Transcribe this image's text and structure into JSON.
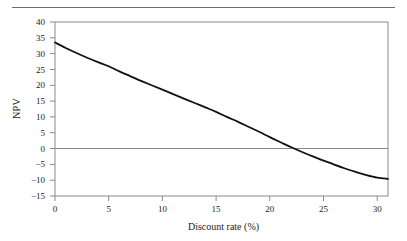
{
  "figure": {
    "top_rule": true,
    "background": "#ffffff",
    "frame_color": "#8a8a8a",
    "curve_color": "#111111",
    "text_color": "#1c1c1c"
  },
  "chart_data": {
    "type": "line",
    "title": "",
    "xlabel": "Discount rate (%)",
    "ylabel": "NPV",
    "xlim": [
      0,
      31
    ],
    "ylim": [
      -15,
      40
    ],
    "xticks": [
      0,
      5,
      10,
      15,
      20,
      25,
      30
    ],
    "xtick_labels": [
      "0",
      "5",
      "10",
      "15",
      "20",
      "25",
      "30"
    ],
    "yticks": [
      -15,
      -10,
      -5,
      0,
      5,
      10,
      15,
      20,
      25,
      30,
      35,
      40
    ],
    "ytick_labels": [
      "−15",
      "−10",
      "−5",
      "0",
      "5",
      "10",
      "15",
      "20",
      "25",
      "30",
      "35",
      "40"
    ],
    "grid": false,
    "zero_line": true,
    "legend": null,
    "annotations": [],
    "series": [
      {
        "name": "NPV",
        "x": [
          0,
          1,
          2,
          3,
          4,
          5,
          6,
          7,
          8,
          9,
          10,
          11,
          12,
          13,
          14,
          15,
          16,
          17,
          18,
          19,
          20,
          21,
          22,
          23,
          24,
          25,
          26,
          27,
          28,
          29,
          30,
          31
        ],
        "values": [
          33.5,
          31.8,
          30.2,
          28.7,
          27.3,
          26.0,
          24.4,
          22.9,
          21.4,
          20.0,
          18.6,
          17.2,
          15.8,
          14.4,
          13.0,
          11.6,
          10.0,
          8.5,
          6.9,
          5.3,
          3.6,
          2.0,
          0.4,
          -1.1,
          -2.5,
          -3.8,
          -5.1,
          -6.3,
          -7.4,
          -8.4,
          -9.2,
          -9.6
        ]
      }
    ],
    "zero_crossing_x": 19.3
  }
}
